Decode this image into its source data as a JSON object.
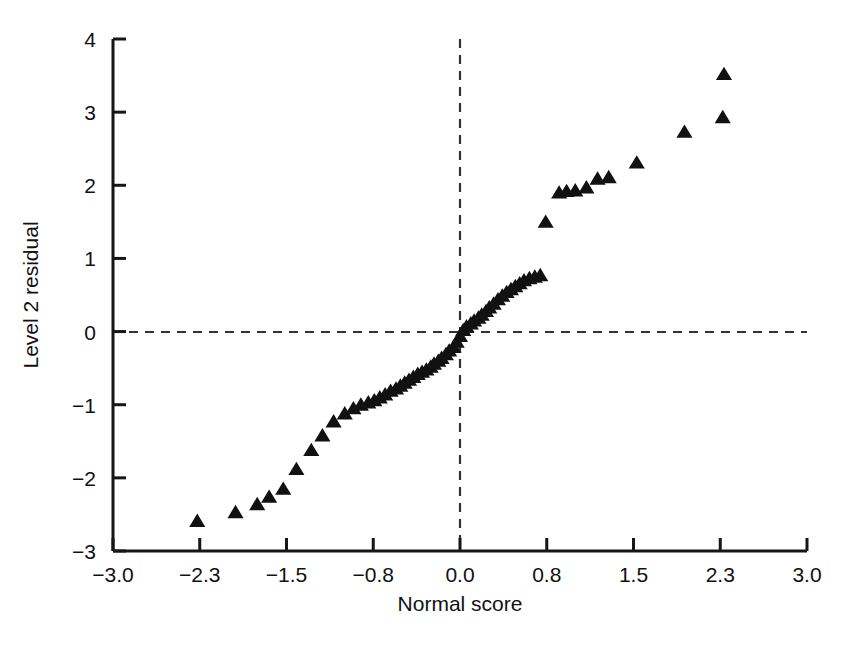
{
  "chart_data": {
    "type": "scatter",
    "title": "",
    "xlabel": "Normal score",
    "ylabel": "Level 2 residual",
    "xlim": [
      -3.0,
      3.0
    ],
    "ylim": [
      -3,
      4
    ],
    "xticks": [
      -3.0,
      -2.3,
      -1.5,
      -0.8,
      0.0,
      0.8,
      1.5,
      2.3,
      3.0
    ],
    "xtick_labels": [
      "−3.0",
      "−2.3",
      "−1.5",
      "−0.8",
      "0.0",
      "0.8",
      "1.5",
      "2.3",
      "3.0"
    ],
    "yticks": [
      -3,
      -2,
      -1,
      0,
      1,
      2,
      3,
      4
    ],
    "ytick_labels": [
      "−3",
      "−2",
      "−1",
      "0",
      "1",
      "2",
      "3",
      "4"
    ],
    "grid": false,
    "legend": null,
    "marker": "triangle-up",
    "marker_color": "#111111",
    "marker_size": 13,
    "reference_lines": [
      {
        "orientation": "horizontal",
        "value": 0,
        "style": "dashed",
        "color": "#333333"
      },
      {
        "orientation": "vertical",
        "value": 0,
        "style": "dashed",
        "color": "#333333"
      }
    ],
    "n_points": 63,
    "x": [
      -2.32,
      -1.97,
      -1.77,
      -1.66,
      -1.53,
      -1.42,
      -1.3,
      -1.21,
      -1.12,
      -1.03,
      -0.96,
      -0.9,
      -0.84,
      -0.79,
      -0.74,
      -0.69,
      -0.64,
      -0.59,
      -0.55,
      -0.51,
      -0.47,
      -0.43,
      -0.39,
      -0.35,
      -0.31,
      -0.27,
      -0.24,
      -0.2,
      -0.17,
      -0.13,
      -0.1,
      -0.06,
      -0.03,
      0.0,
      0.03,
      0.06,
      0.1,
      0.13,
      0.17,
      0.2,
      0.24,
      0.27,
      0.31,
      0.35,
      0.39,
      0.43,
      0.47,
      0.51,
      0.55,
      0.59,
      0.64,
      0.69,
      0.74,
      0.79,
      0.9,
      0.96,
      1.03,
      1.12,
      1.21,
      1.3,
      1.53,
      1.97,
      2.32
    ],
    "y": [
      -2.59,
      -2.47,
      -2.36,
      -2.26,
      -2.15,
      -1.88,
      -1.62,
      -1.42,
      -1.23,
      -1.12,
      -1.05,
      -1.0,
      -0.97,
      -0.94,
      -0.9,
      -0.86,
      -0.81,
      -0.78,
      -0.74,
      -0.7,
      -0.66,
      -0.62,
      -0.58,
      -0.55,
      -0.52,
      -0.48,
      -0.44,
      -0.4,
      -0.36,
      -0.31,
      -0.26,
      -0.21,
      -0.14,
      -0.06,
      0.02,
      0.07,
      0.11,
      0.15,
      0.19,
      0.23,
      0.28,
      0.33,
      0.38,
      0.44,
      0.49,
      0.54,
      0.58,
      0.62,
      0.66,
      0.7,
      0.73,
      0.75,
      0.77,
      1.5,
      1.9,
      1.92,
      1.93,
      1.97,
      2.09,
      2.11,
      2.31,
      2.73,
      2.93
    ],
    "extra_points": [
      {
        "x": 2.33,
        "y": 3.52
      }
    ]
  }
}
